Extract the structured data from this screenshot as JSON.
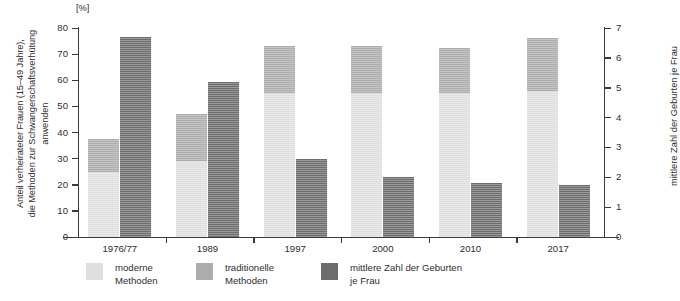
{
  "chart_data": {
    "type": "bar",
    "title": "",
    "unit_label": "[%]",
    "ylabel": "Anteil verheirateter Frauen (15–49 Jahre),\ndie Methoden zur Schwangerschaftsverhütung\nanwenden",
    "y2label": "mittlere Zahl der Geburten je Frau",
    "xlabel": "",
    "categories": [
      "1976/77",
      "1989",
      "1997",
      "2000",
      "2010",
      "2017"
    ],
    "ylim": [
      0,
      80
    ],
    "yticks": [
      0,
      10,
      20,
      30,
      40,
      50,
      60,
      70,
      80
    ],
    "y2lim": [
      0,
      7
    ],
    "y2ticks": [
      0,
      1,
      2,
      3,
      4,
      5,
      6,
      7
    ],
    "grid": false,
    "legend_position": "bottom",
    "series": [
      {
        "name": "moderne Methoden",
        "axis": "left",
        "stacked": true,
        "color": "#dfdfdf",
        "values": [
          25,
          29,
          55,
          55,
          55,
          56
        ]
      },
      {
        "name": "traditionelle Methoden",
        "axis": "left",
        "stacked": true,
        "color": "#adadad",
        "values": [
          12.5,
          18,
          18,
          18,
          17.5,
          20
        ]
      },
      {
        "name": "mittlere Zahl der Geburten je Frau",
        "axis": "right",
        "stacked": false,
        "color": "#6d6d6d",
        "values": [
          6.7,
          5.2,
          2.6,
          2.0,
          1.8,
          1.75
        ]
      }
    ],
    "stack_totals": [
      37.5,
      47,
      73,
      73,
      72.5,
      76
    ]
  },
  "axes": {
    "left": {
      "unit": "[%]",
      "tick_labels": [
        "80",
        "70",
        "60",
        "50",
        "40",
        "30",
        "20",
        "10",
        "0"
      ],
      "title": "Anteil verheirateter Frauen (15–49 Jahre),\ndie Methoden zur Schwangerschaftsverhütung\nanwenden"
    },
    "right": {
      "tick_labels": [
        "7",
        "6",
        "5",
        "4",
        "3",
        "2",
        "1",
        "0"
      ],
      "title": "mittlere Zahl der Geburten je Frau"
    },
    "bottom": {
      "tick_labels": [
        "1976/77",
        "1989",
        "1997",
        "2000",
        "2010",
        "2017"
      ]
    }
  },
  "legend": {
    "items": [
      {
        "label": "moderne\nMethoden",
        "color": "#dfdfdf"
      },
      {
        "label": "traditionelle\nMethoden",
        "color": "#adadad"
      },
      {
        "label": "mittlere Zahl der Geburten\nje Frau",
        "color": "#6d6d6d"
      }
    ]
  },
  "colors": {
    "modern": "#dfdfdf",
    "traditional": "#adadad",
    "births": "#6d6d6d",
    "axis": "#3a3a3a",
    "text": "#2e2e2e",
    "background": "#ffffff"
  }
}
